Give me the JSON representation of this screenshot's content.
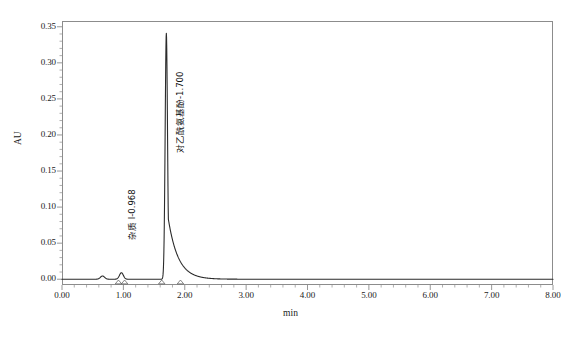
{
  "chart_data": {
    "type": "line",
    "title": "",
    "subtitle": "",
    "xlabel": "min",
    "ylabel": "AU",
    "xlim": [
      0.0,
      8.0
    ],
    "ylim": [
      -0.008,
      0.358
    ],
    "xticks": [
      "0.00",
      "1.00",
      "2.00",
      "3.00",
      "4.00",
      "5.00",
      "6.00",
      "7.00",
      "8.00"
    ],
    "xtick_values": [
      0.0,
      1.0,
      2.0,
      3.0,
      4.0,
      5.0,
      6.0,
      7.0,
      8.0
    ],
    "yticks": [
      "0.00",
      "0.05",
      "0.10",
      "0.15",
      "0.20",
      "0.25",
      "0.30",
      "0.35"
    ],
    "ytick_values": [
      0.0,
      0.05,
      0.1,
      0.15,
      0.2,
      0.25,
      0.3,
      0.35
    ],
    "x_minor_ticks_per_major": 5,
    "y_minor_ticks_per_major": 5,
    "grid": false,
    "legend": "none",
    "trace_color": "#2b2b2b",
    "frame_color": "#8c8c8c",
    "baseline_value": 0.0,
    "peaks": [
      {
        "label": "杂质 I-0.968",
        "name": "impurity-1",
        "retention_time": 0.968,
        "height": 0.009,
        "width": 0.07,
        "marker_start": 0.92,
        "marker_end": 1.02,
        "label_x": 0.955,
        "label_y": 0.055
      },
      {
        "label": "对乙酰氨基酚-1.700",
        "name": "acetaminophen",
        "retention_time": 1.7,
        "height": 0.341,
        "width": 0.045,
        "tail": 0.16,
        "marker_start": 1.625,
        "marker_end": 1.93,
        "label_x": 1.745,
        "label_y": 0.175
      }
    ],
    "unlabeled_features": [
      {
        "name": "solvent-bump",
        "x": 0.66,
        "height": 0.0045,
        "width": 0.075
      }
    ],
    "series": [
      {
        "name": "detector-signal",
        "xlabel": "min",
        "ylabel": "AU",
        "x": [
          0.0,
          0.2,
          0.4,
          0.55,
          0.62,
          0.66,
          0.7,
          0.78,
          0.88,
          0.93,
          0.968,
          1.01,
          1.06,
          1.15,
          1.3,
          1.5,
          1.6,
          1.64,
          1.68,
          1.7,
          1.72,
          1.76,
          1.8,
          1.86,
          1.93,
          2.0,
          2.2,
          2.6,
          3.0,
          4.0,
          5.0,
          6.0,
          7.0,
          8.0
        ],
        "y": [
          0.0,
          0.0,
          0.0,
          0.0005,
          0.003,
          0.0045,
          0.003,
          0.0008,
          0.0015,
          0.006,
          0.009,
          0.005,
          0.001,
          0.0,
          0.0,
          0.0,
          0.0008,
          0.02,
          0.26,
          0.341,
          0.25,
          0.055,
          0.018,
          0.006,
          0.002,
          0.0005,
          0.0,
          0.0,
          0.0,
          0.0,
          0.0,
          0.0,
          0.0,
          0.0
        ]
      }
    ]
  }
}
